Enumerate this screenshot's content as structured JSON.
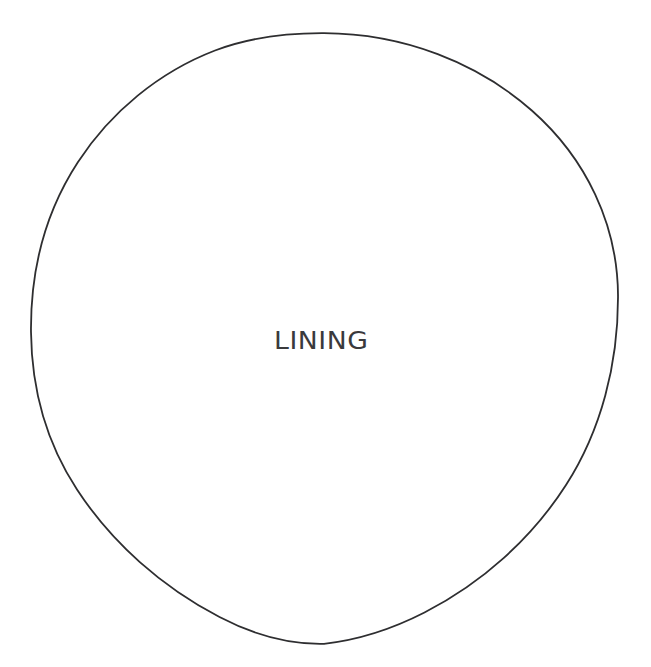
{
  "document": {
    "type": "technical-line-drawing",
    "title": "LINING",
    "width": 651,
    "height": 667,
    "background_color": "#ffffff"
  },
  "drawing": {
    "style": "hand-drawn-single-stroke-outline",
    "stroke_color": "#2e2e30",
    "stroke_width": 1.8,
    "fill": "none",
    "shapes": [
      {
        "name": "lining-outline",
        "kind": "circle",
        "center_x": 324.5,
        "center_y": 338.5,
        "radius_x": 293.5,
        "radius_y": 305.5,
        "bounds": {
          "left": 31,
          "top": 33,
          "right": 618,
          "bottom": 644
        }
      }
    ]
  },
  "labels": [
    {
      "id": "lining",
      "text": "LINING",
      "color": "#3a3a3c",
      "x": 274,
      "y": 328,
      "cap_height": 22,
      "bounds": {
        "left": 274,
        "top": 330,
        "right": 374,
        "bottom": 352
      }
    }
  ]
}
